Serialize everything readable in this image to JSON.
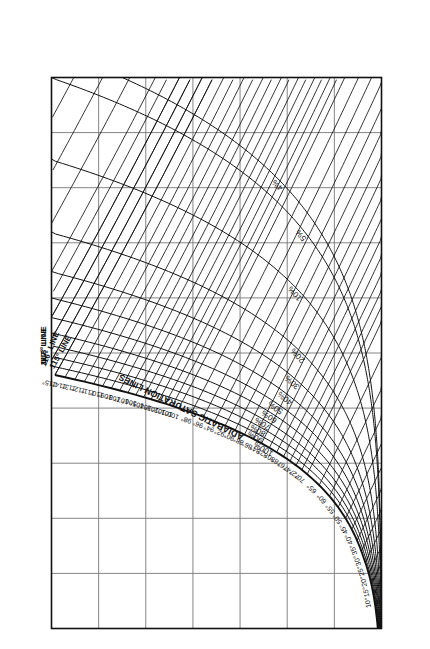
{
  "chart_data": {
    "type": "line",
    "xlabel": "TEMPERATURE, °F",
    "ylabel": "HUMIDITY, LB WATER VAPOR PER LB. DRY AIR",
    "xlim": [
      0,
      250
    ],
    "ylim": [
      0.0,
      0.07
    ],
    "grid": true,
    "legend_position": "none",
    "orientation": "rotated-90-ccw",
    "x_ticks": [
      0,
      25,
      50,
      75,
      100,
      125,
      150,
      175,
      200,
      225,
      250
    ],
    "x_tick_labels": [
      "0",
      "25",
      "50",
      "75",
      "100",
      "125",
      "150",
      "175",
      "200",
      "225",
      "250"
    ],
    "y_ticks": [
      0.0,
      0.01,
      0.02,
      0.03,
      0.04,
      0.05,
      0.06,
      0.07
    ],
    "y_tick_labels": [
      "0.00",
      "0.01",
      "0.02",
      "0.03",
      "0.04",
      "0.05",
      "0.06",
      "0.07"
    ],
    "annotations": [
      {
        "text": "ADIABATIC SATURATION LINES",
        "kind": "family-label"
      },
      {
        "text": "118° LINE",
        "kind": "adiabatic-line-label"
      },
      {
        "text": "117° LINE",
        "kind": "adiabatic-line-label"
      },
      {
        "text": "116° LINE",
        "kind": "adiabatic-line-label"
      },
      {
        "text": "115° LINE",
        "kind": "adiabatic-line-label"
      }
    ],
    "series": [
      {
        "name": "Relative humidity curves",
        "kind": "rh",
        "labels": [
          "4%",
          "5%",
          "10%",
          "20%",
          "30%",
          "40%",
          "50%",
          "60%",
          "70%",
          "80%",
          "90%",
          "100%"
        ],
        "values": [
          4,
          5,
          10,
          20,
          30,
          40,
          50,
          60,
          70,
          80,
          90,
          100
        ]
      },
      {
        "name": "Wet bulb / adiabatic saturation temperatures",
        "kind": "wetbulb",
        "labels": [
          "10°",
          "15°",
          "20°",
          "25°",
          "30°",
          "35°",
          "40°",
          "45°",
          "50°",
          "55°",
          "60°",
          "65°",
          "70°",
          "72°",
          "74°",
          "76°",
          "78°",
          "80°",
          "82°",
          "84°",
          "86°",
          "88°",
          "90°",
          "92°",
          "94°",
          "96°",
          "98°",
          "100°",
          "101°",
          "102°",
          "103°",
          "104°",
          "105°",
          "106°",
          "107°",
          "108°",
          "109°",
          "110°",
          "111°",
          "112°",
          "113°",
          "114°",
          "115°",
          "116°",
          "117°",
          "118°"
        ],
        "values": [
          10,
          15,
          20,
          25,
          30,
          35,
          40,
          45,
          50,
          55,
          60,
          65,
          70,
          72,
          74,
          76,
          78,
          80,
          82,
          84,
          86,
          88,
          90,
          92,
          94,
          96,
          98,
          100,
          101,
          102,
          103,
          104,
          105,
          106,
          107,
          108,
          109,
          110,
          111,
          112,
          113,
          114,
          115,
          116,
          117,
          118
        ]
      }
    ],
    "colors": {
      "ink": "#111111",
      "grid": "#777777",
      "background": "#ffffff"
    }
  },
  "axes": {
    "temperature_label": "TEMPERATURE, °F",
    "humidity_label_top": "HUMIDITY, LB WATER VAPOR PER LB. DRY AIR",
    "humidity_label_bottom": "HUMIDITY, LB WATER VAPOR PER LB. DRY AIR"
  }
}
